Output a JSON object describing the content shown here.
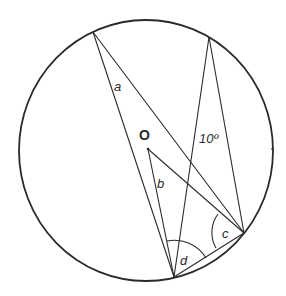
{
  "diagram": {
    "center_label": "O",
    "given_angle_label": "10º",
    "unknown_labels": [
      "a",
      "b",
      "c",
      "d"
    ],
    "labels": {
      "a": "a",
      "b": "b",
      "c": "c",
      "d": "d",
      "given": "10º",
      "center": "O"
    },
    "colors": {
      "line": "#2a2a2a",
      "background": "#ffffff"
    }
  }
}
